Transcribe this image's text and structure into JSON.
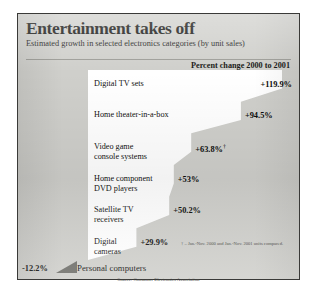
{
  "title": "Entertainment takes off",
  "subtitle": "Estimated growth in selected electronics categories (by unit sales)",
  "column_header": "Percent change 2000 to 2001",
  "footnote": "† – Jan.-Nov. 2000 and Jan.-Nov. 2001 units compared.",
  "source": "Source: Consumer Electronics Association",
  "negative_value_label": "-12.2%",
  "negative_category_label": "Personal computers",
  "colors": {
    "background": "#cfcfcb",
    "bar": "#ffffff",
    "negative_bar": "#6d6d68",
    "border": "#3a3a38",
    "text": "#121210"
  },
  "chart_data": {
    "type": "bar",
    "title": "Entertainment takes off",
    "subtitle": "Estimated growth in selected electronics categories (by unit sales)",
    "xlabel": "Percent change 2000 to 2001",
    "ylabel": "",
    "orientation": "horizontal",
    "grid": false,
    "legend": false,
    "xlim": [
      -12.2,
      119.9
    ],
    "source": "Source: Consumer Electronics Association",
    "note": "† – Jan.-Nov. 2000 and Jan.-Nov. 2001 units compared.",
    "categories": [
      "Digital TV sets",
      "Home theater-in-a-box",
      "Video game console systems",
      "Home component DVD players",
      "Satellite TV receivers",
      "Digital cameras",
      "Personal computers"
    ],
    "values": [
      119.9,
      94.5,
      63.8,
      53,
      50.2,
      29.9,
      -12.2
    ],
    "value_labels": [
      "+119.9%",
      "+94.5%",
      "+63.8%",
      "+53%",
      "+50.2%",
      "+29.9%",
      "-12.2%"
    ],
    "bars": [
      {
        "category_lines": [
          "Digital TV sets"
        ],
        "value": 119.9,
        "label": "+119.9%",
        "footnote_marker": false
      },
      {
        "category_lines": [
          "Home theater-in-a-box"
        ],
        "value": 94.5,
        "label": "+94.5%",
        "footnote_marker": false
      },
      {
        "category_lines": [
          "Video game",
          "console systems"
        ],
        "value": 63.8,
        "label": "+63.8%",
        "footnote_marker": true
      },
      {
        "category_lines": [
          "Home component",
          "DVD players"
        ],
        "value": 53,
        "label": "+53%",
        "footnote_marker": false
      },
      {
        "category_lines": [
          "Satellite TV",
          "receivers"
        ],
        "value": 50.2,
        "label": "+50.2%",
        "footnote_marker": false
      },
      {
        "category_lines": [
          "Digital",
          "cameras"
        ],
        "value": 29.9,
        "label": "+29.9%",
        "footnote_marker": false
      },
      {
        "category_lines": [
          "Personal computers"
        ],
        "value": -12.2,
        "label": "-12.2%",
        "footnote_marker": false
      }
    ]
  }
}
